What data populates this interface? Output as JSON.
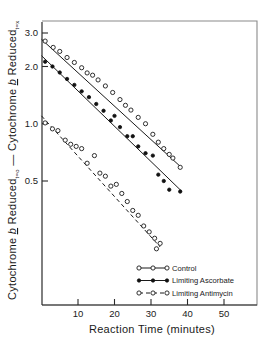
{
  "chart_data": {
    "type": "scatter",
    "title": "",
    "xlabel": "Reaction Time (minutes)",
    "ylabel": "Cytochrome b Reduced t=o - Cytochrome b Reduced t=x",
    "ylabel_parts": {
      "term1": "Cytochrome",
      "italic1": "b",
      "term2": "Reduced",
      "sub1": "t=o",
      "minus": "—",
      "term3": "Cytochrome",
      "italic2": "b",
      "term4": "Reduced",
      "sub2": "t=x"
    },
    "xlabel_parts": {
      "word1": "Reaction",
      "word2": "Time",
      "word3": "(minutes)"
    },
    "yscale": "log",
    "ylim": [
      0.17,
      3.4
    ],
    "xlim": [
      -2,
      58
    ],
    "xticks": [
      10,
      20,
      30,
      40,
      50
    ],
    "xtick_labels": [
      "10",
      "20",
      "30",
      "40",
      "50"
    ],
    "yticks": [
      3.0,
      2.0,
      1.0,
      0.5
    ],
    "ytick_labels": [
      "3.0",
      "2.0",
      "1.0",
      "0.5"
    ],
    "grid": false,
    "legend_position": "lower-right",
    "series": [
      {
        "name": "Control",
        "marker": "open-circle",
        "line": "solid",
        "fit": {
          "x0": 0,
          "y0": 2.78,
          "x1": 38.5,
          "y1": 0.585
        },
        "points": [
          {
            "x": 1.0,
            "y": 2.72
          },
          {
            "x": 3.2,
            "y": 2.52
          },
          {
            "x": 5.0,
            "y": 2.4
          },
          {
            "x": 7.0,
            "y": 2.23
          },
          {
            "x": 9.0,
            "y": 2.1
          },
          {
            "x": 11.0,
            "y": 1.97
          },
          {
            "x": 12.5,
            "y": 1.85
          },
          {
            "x": 14.0,
            "y": 1.8
          },
          {
            "x": 15.5,
            "y": 1.7
          },
          {
            "x": 17.5,
            "y": 1.58
          },
          {
            "x": 19.5,
            "y": 1.46
          },
          {
            "x": 21.5,
            "y": 1.34
          },
          {
            "x": 23.0,
            "y": 1.25
          },
          {
            "x": 24.5,
            "y": 1.18
          },
          {
            "x": 26.5,
            "y": 1.08
          },
          {
            "x": 28.5,
            "y": 1.0
          },
          {
            "x": 30.5,
            "y": 0.88
          },
          {
            "x": 32.0,
            "y": 0.8
          },
          {
            "x": 33.5,
            "y": 0.74
          },
          {
            "x": 35.0,
            "y": 0.69
          },
          {
            "x": 36.0,
            "y": 0.66
          },
          {
            "x": 38.0,
            "y": 0.59
          }
        ]
      },
      {
        "name": "Limiting Ascorbate",
        "marker": "filled-circle",
        "line": "solid",
        "fit": {
          "x0": 0,
          "y0": 2.28,
          "x1": 38.5,
          "y1": 0.44
        },
        "points": [
          {
            "x": 1.0,
            "y": 2.12
          },
          {
            "x": 3.0,
            "y": 2.0
          },
          {
            "x": 5.0,
            "y": 1.86
          },
          {
            "x": 7.0,
            "y": 1.72
          },
          {
            "x": 9.0,
            "y": 1.6
          },
          {
            "x": 11.0,
            "y": 1.48
          },
          {
            "x": 13.0,
            "y": 1.38
          },
          {
            "x": 15.0,
            "y": 1.27
          },
          {
            "x": 17.0,
            "y": 1.17
          },
          {
            "x": 19.0,
            "y": 1.04
          },
          {
            "x": 20.0,
            "y": 1.1
          },
          {
            "x": 21.5,
            "y": 0.96
          },
          {
            "x": 23.5,
            "y": 0.86
          },
          {
            "x": 25.0,
            "y": 0.86
          },
          {
            "x": 26.5,
            "y": 0.76
          },
          {
            "x": 28.5,
            "y": 0.7
          },
          {
            "x": 30.5,
            "y": 0.68
          },
          {
            "x": 32.0,
            "y": 0.54
          },
          {
            "x": 33.5,
            "y": 0.5
          },
          {
            "x": 35.0,
            "y": 0.45
          },
          {
            "x": 38.0,
            "y": 0.44
          }
        ]
      },
      {
        "name": "Limiting Antimycin",
        "marker": "open-circle",
        "line": "dashed",
        "fit": {
          "x0": 0,
          "y0": 1.1,
          "x1": 32.5,
          "y1": 0.225
        },
        "points": [
          {
            "x": 1.0,
            "y": 1.01
          },
          {
            "x": 3.0,
            "y": 0.94
          },
          {
            "x": 4.5,
            "y": 0.92
          },
          {
            "x": 6.5,
            "y": 0.82
          },
          {
            "x": 8.0,
            "y": 0.78
          },
          {
            "x": 9.5,
            "y": 0.76
          },
          {
            "x": 11.0,
            "y": 0.74
          },
          {
            "x": 12.5,
            "y": 0.62
          },
          {
            "x": 14.5,
            "y": 0.68
          },
          {
            "x": 16.0,
            "y": 0.55
          },
          {
            "x": 17.5,
            "y": 0.53
          },
          {
            "x": 19.0,
            "y": 0.47
          },
          {
            "x": 20.5,
            "y": 0.48
          },
          {
            "x": 22.0,
            "y": 0.43
          },
          {
            "x": 23.5,
            "y": 0.39
          },
          {
            "x": 25.0,
            "y": 0.35
          },
          {
            "x": 26.5,
            "y": 0.33
          },
          {
            "x": 28.0,
            "y": 0.29
          },
          {
            "x": 29.5,
            "y": 0.27
          },
          {
            "x": 31.0,
            "y": 0.25
          },
          {
            "x": 31.5,
            "y": 0.22
          },
          {
            "x": 32.5,
            "y": 0.235
          }
        ]
      }
    ],
    "legend": [
      {
        "label": "Control",
        "marker": "open-circle",
        "line": "solid"
      },
      {
        "label": "Limiting Ascorbate",
        "marker": "filled-circle",
        "line": "solid"
      },
      {
        "label": "Limiting Antimycin",
        "marker": "open-circle",
        "line": "dashed"
      }
    ],
    "colors": {
      "ink": "#1a1a1a",
      "frame": "#8a8a8a",
      "background": "#ffffff"
    }
  }
}
